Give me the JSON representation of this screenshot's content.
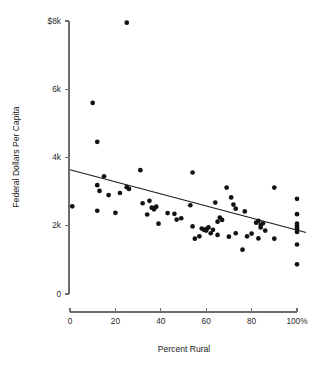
{
  "chart_data": {
    "type": "scatter",
    "title": "",
    "subtitle": "",
    "xlabel": "Percent Rural",
    "ylabel": "Federal Dollars Per Capita",
    "xlim": [
      0,
      100
    ],
    "ylim": [
      0,
      8000
    ],
    "grid": false,
    "legend": null,
    "x_ticks": [
      0,
      20,
      40,
      60,
      80,
      100
    ],
    "x_tick_labels": [
      "0",
      "20",
      "40",
      "60",
      "80",
      "100%"
    ],
    "y_ticks": [
      0,
      2000,
      4000,
      6000,
      8000
    ],
    "y_tick_labels": [
      "0",
      "2k",
      "4k",
      "6k",
      "$8k"
    ],
    "points": [
      [
        1,
        2570
      ],
      [
        10,
        5600
      ],
      [
        12,
        4460
      ],
      [
        12,
        3190
      ],
      [
        12,
        2440
      ],
      [
        13,
        3020
      ],
      [
        15,
        3450
      ],
      [
        17,
        2900
      ],
      [
        20,
        2380
      ],
      [
        22,
        2960
      ],
      [
        25,
        7950
      ],
      [
        25,
        3130
      ],
      [
        26,
        3080
      ],
      [
        31,
        3630
      ],
      [
        32,
        2660
      ],
      [
        34,
        2330
      ],
      [
        35,
        2730
      ],
      [
        36,
        2530
      ],
      [
        37,
        2520
      ],
      [
        37,
        2480
      ],
      [
        38,
        2560
      ],
      [
        39,
        2060
      ],
      [
        43,
        2370
      ],
      [
        46,
        2350
      ],
      [
        47,
        2180
      ],
      [
        49,
        2220
      ],
      [
        53,
        2600
      ],
      [
        54,
        3560
      ],
      [
        54,
        1980
      ],
      [
        55,
        1620
      ],
      [
        57,
        1690
      ],
      [
        58,
        1920
      ],
      [
        59,
        1880
      ],
      [
        60,
        1900
      ],
      [
        60,
        1860
      ],
      [
        61,
        1950
      ],
      [
        62,
        1780
      ],
      [
        63,
        1880
      ],
      [
        64,
        2680
      ],
      [
        65,
        2120
      ],
      [
        65,
        1730
      ],
      [
        66,
        2240
      ],
      [
        67,
        2170
      ],
      [
        69,
        3120
      ],
      [
        70,
        1680
      ],
      [
        71,
        2830
      ],
      [
        72,
        2620
      ],
      [
        73,
        2500
      ],
      [
        73,
        1780
      ],
      [
        76,
        1300
      ],
      [
        77,
        2420
      ],
      [
        78,
        1690
      ],
      [
        80,
        1770
      ],
      [
        82,
        2090
      ],
      [
        83,
        2140
      ],
      [
        83,
        1630
      ],
      [
        84,
        2020
      ],
      [
        84,
        1950
      ],
      [
        85,
        2070
      ],
      [
        86,
        1860
      ],
      [
        90,
        3120
      ],
      [
        90,
        1620
      ],
      [
        100,
        2790
      ],
      [
        100,
        2340
      ],
      [
        100,
        2060
      ],
      [
        100,
        2000
      ],
      [
        100,
        1950
      ],
      [
        100,
        1900
      ],
      [
        100,
        1820
      ],
      [
        100,
        1450
      ],
      [
        100,
        870
      ]
    ],
    "fit_line": {
      "name": "least-squares fit",
      "x_start": 0,
      "y_start": 3640,
      "x_end": 104,
      "y_end": 1800
    }
  }
}
